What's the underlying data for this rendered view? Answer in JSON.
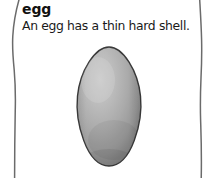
{
  "entry": {
    "title": "egg",
    "description": "An egg has a thin hard shell."
  },
  "illustration": {
    "subject": "egg",
    "alt": "A grey speckled chicken egg, narrow at the top and rounded at the bottom."
  },
  "colors": {
    "page_background": "#ffffff",
    "text": "#111111",
    "description_text": "#1a1a1a",
    "frame_rule": "#6b6b6b",
    "egg_highlight": "#c2c2c2",
    "egg_midtone": "#a9a9a9",
    "egg_shadow": "#848484",
    "egg_outline": "#3a3a3a"
  },
  "frame": {
    "left_rule_name": "left-wavy-rule",
    "right_rule_name": "right-wavy-rule"
  }
}
